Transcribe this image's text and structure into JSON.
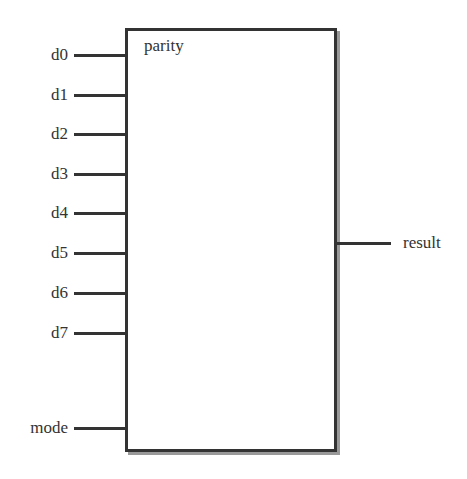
{
  "block": {
    "name": "parity"
  },
  "inputs": [
    {
      "label": "d0",
      "y": 55
    },
    {
      "label": "d1",
      "y": 95
    },
    {
      "label": "d2",
      "y": 134
    },
    {
      "label": "d3",
      "y": 174
    },
    {
      "label": "d4",
      "y": 213
    },
    {
      "label": "d5",
      "y": 253
    },
    {
      "label": "d6",
      "y": 293
    },
    {
      "label": "d7",
      "y": 333
    },
    {
      "label": "mode",
      "y": 428
    }
  ],
  "outputs": [
    {
      "label": "result",
      "y": 243
    }
  ]
}
